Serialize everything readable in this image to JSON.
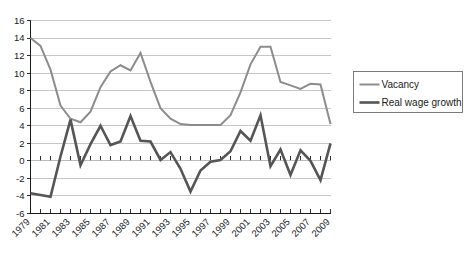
{
  "chart_data": {
    "type": "line",
    "title": "",
    "subtitle": "",
    "xlabel": "",
    "ylabel": "",
    "x": [
      1979,
      1980,
      1981,
      1982,
      1983,
      1984,
      1985,
      1986,
      1987,
      1988,
      1989,
      1990,
      1991,
      1992,
      1993,
      1994,
      1995,
      1996,
      1997,
      1998,
      1999,
      2000,
      2001,
      2002,
      2003,
      2004,
      2005,
      2006,
      2007,
      2008,
      2009
    ],
    "xlim": [
      1979,
      2009
    ],
    "ylim": [
      -6,
      16
    ],
    "ytick_values": [
      -6,
      -4,
      -2,
      0,
      2,
      4,
      6,
      8,
      10,
      12,
      14,
      16
    ],
    "ytick_labels": [
      "-6",
      "-4",
      "-2",
      "0",
      "2",
      "4",
      "6",
      "8",
      "10",
      "12",
      "14",
      "16"
    ],
    "xtick_values": [
      1979,
      1981,
      1983,
      1985,
      1987,
      1989,
      1991,
      1993,
      1995,
      1997,
      1999,
      2001,
      2003,
      2005,
      2007,
      2009
    ],
    "xtick_labels": [
      "1979",
      "1981",
      "1983",
      "1985",
      "1987",
      "1989",
      "1991",
      "1993",
      "1995",
      "1997",
      "1999",
      "2001",
      "2003",
      "2005",
      "2007",
      "2009"
    ],
    "xtick_minor_values": [
      1979,
      1980,
      1981,
      1982,
      1983,
      1984,
      1985,
      1986,
      1987,
      1988,
      1989,
      1990,
      1991,
      1992,
      1993,
      1994,
      1995,
      1996,
      1997,
      1998,
      1999,
      2000,
      2001,
      2002,
      2003,
      2004,
      2005,
      2006,
      2007,
      2008,
      2009
    ],
    "grid": true,
    "grid_axis": "y",
    "grid_color": "#b9b9b9",
    "legend_position": "right",
    "series": [
      {
        "name": "Vacancy",
        "color": "#8c8c8c",
        "width": 2.0,
        "values": [
          14.0,
          13.1,
          10.4,
          6.3,
          4.8,
          4.4,
          5.6,
          8.4,
          10.2,
          10.9,
          10.3,
          12.3,
          9.0,
          6.0,
          4.8,
          4.2,
          4.1,
          4.1,
          4.1,
          4.1,
          5.2,
          7.8,
          11.0,
          13.0,
          13.0,
          9.0,
          8.6,
          8.2,
          8.8,
          8.7,
          4.2
        ]
      },
      {
        "name": "Real wage growth",
        "color": "#555555",
        "width": 2.6,
        "values": [
          -3.7,
          -3.9,
          -4.1,
          0.5,
          4.7,
          -0.5,
          1.9,
          4.0,
          1.8,
          2.2,
          5.1,
          2.3,
          2.2,
          0.1,
          1.0,
          -0.9,
          -3.5,
          -1.1,
          -0.1,
          0.1,
          1.1,
          3.4,
          2.3,
          5.2,
          -0.6,
          1.3,
          -1.6,
          1.2,
          0.0,
          -2.2,
          2.0
        ]
      }
    ],
    "legend": [
      {
        "label": "Vacancy"
      },
      {
        "label": "Real wage growth"
      }
    ]
  }
}
